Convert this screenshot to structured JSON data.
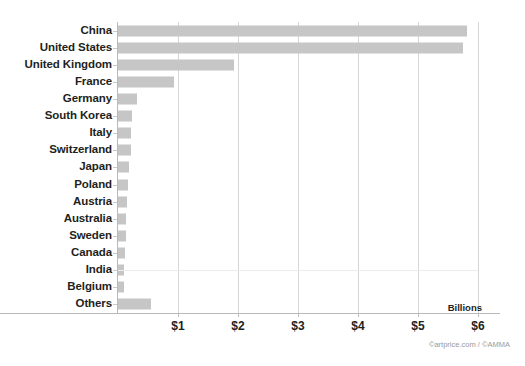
{
  "chart_data": {
    "type": "bar",
    "orientation": "horizontal",
    "title": "",
    "subtitle": "",
    "xlabel": "Billions",
    "ylabel": "",
    "xlim": [
      0,
      6.4
    ],
    "grid": true,
    "legend": false,
    "legend_position": "none",
    "categories": [
      "China",
      "United States",
      "United Kingdom",
      "France",
      "Germany",
      "South Korea",
      "Italy",
      "Switzerland",
      "Japan",
      "Poland",
      "Austria",
      "Australia",
      "Sweden",
      "Canada",
      "India",
      "Belgium",
      "Others"
    ],
    "values": [
      5.82,
      5.75,
      1.93,
      0.93,
      0.32,
      0.23,
      0.21,
      0.21,
      0.19,
      0.17,
      0.15,
      0.14,
      0.13,
      0.12,
      0.1,
      0.1,
      0.55
    ],
    "xticks": [
      1,
      2,
      3,
      4,
      5,
      6
    ],
    "xtick_labels": [
      "$1",
      "$2",
      "$3",
      "$4",
      "$5",
      "$6"
    ],
    "bar_color": "#c6c6c6",
    "gridline_color": "#d6d6d6",
    "axis_color": "#b9b9b9",
    "text_color": "#231f20",
    "background": "#ffffff"
  },
  "axis": {
    "units_label": "Billions"
  },
  "footer": {
    "credit": "©artprice.com / ©AMMA"
  }
}
